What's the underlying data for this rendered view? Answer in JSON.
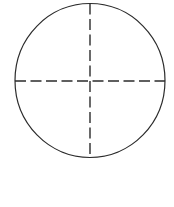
{
  "canvas": {
    "width": 174,
    "height": 207,
    "background_color": "#ffffff"
  },
  "figure": {
    "title": "",
    "caption": ""
  },
  "style": {
    "outline_color": "#2b2b2b",
    "outline_width": 1.2,
    "dash_color": "#2b2b2b",
    "dash_width": 1.4,
    "dash_pattern": "11 4.5"
  },
  "geometry": {
    "circle": {
      "center_x": 90,
      "center_y": 80.5,
      "radius_x": 75,
      "radius_y": 77
    },
    "vertical_axis": {
      "x": 90,
      "y_start": 3.5,
      "y_end": 157.5
    },
    "horizontal_axis": {
      "y": 81,
      "x_start": 15,
      "x_end": 165
    }
  },
  "labels": {
    "circle_outline": "circle-outline",
    "vertical_diameter": "vertical-dashed-diameter",
    "horizontal_diameter": "horizontal-dashed-diameter",
    "center_point": "center-intersection"
  }
}
